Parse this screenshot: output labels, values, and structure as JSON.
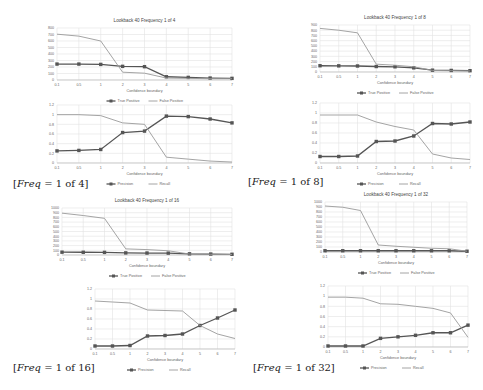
{
  "captions": [
    {
      "prefix": "[",
      "var": "Freq",
      "rest": " = 1 of 4]"
    },
    {
      "prefix": "[",
      "var": "Freq",
      "rest": " = 1 of 8]"
    },
    {
      "prefix": "[",
      "var": "Freq",
      "rest": " = 1 of 16]"
    },
    {
      "prefix": "[",
      "var": "Freq",
      "rest": " = 1 of 32]"
    }
  ],
  "colors": {
    "series_dark": "#555555",
    "series_light": "#9a9a9a",
    "grid": "#e2e2e2",
    "text": "#666666"
  },
  "chart_data": [
    {
      "type": "line",
      "title": "Lookback 40 Frequency 1 of 4",
      "xlabel": "Confidence boundary",
      "ylabel": "",
      "categories": [
        "0.1",
        "0.5",
        "1",
        "2",
        "3",
        "4",
        "5",
        "6",
        "7"
      ],
      "ylim": [
        0,
        800
      ],
      "yticks": [
        0,
        100,
        200,
        300,
        400,
        500,
        600,
        700,
        800
      ],
      "grid": true,
      "legend_position": "bottom",
      "series": [
        {
          "name": "True Positive",
          "marker": "square",
          "values": [
            245,
            245,
            240,
            210,
            205,
            50,
            40,
            30,
            25
          ]
        },
        {
          "name": "False Positive",
          "marker": "none",
          "values": [
            705,
            675,
            600,
            120,
            105,
            30,
            25,
            20,
            20
          ]
        }
      ]
    },
    {
      "type": "line",
      "title": "",
      "xlabel": "Confidence boundary",
      "ylabel": "",
      "categories": [
        "0.1",
        "0.5",
        "1",
        "2",
        "3",
        "4",
        "5",
        "6",
        "7"
      ],
      "ylim": [
        0,
        1.2
      ],
      "yticks": [
        0,
        0.2,
        0.4,
        0.6,
        0.8,
        1,
        1.2
      ],
      "grid": true,
      "legend_position": "bottom",
      "series": [
        {
          "name": "Precision",
          "marker": "square",
          "values": [
            0.25,
            0.26,
            0.28,
            0.63,
            0.66,
            0.97,
            0.96,
            0.91,
            0.83
          ]
        },
        {
          "name": "Recall",
          "marker": "none",
          "values": [
            1.0,
            1.0,
            0.98,
            0.83,
            0.8,
            0.12,
            0.08,
            0.04,
            0.02
          ]
        }
      ]
    },
    {
      "type": "line",
      "title": "Lookback 40 Frequency 1 of 8",
      "xlabel": "Confidence boundary",
      "ylabel": "",
      "categories": [
        "0.1",
        "0.5",
        "1",
        "2",
        "3",
        "4",
        "5",
        "6",
        "7"
      ],
      "ylim": [
        0,
        900
      ],
      "yticks": [
        0,
        100,
        200,
        300,
        400,
        500,
        600,
        700,
        800,
        900
      ],
      "grid": true,
      "legend_position": "bottom",
      "series": [
        {
          "name": "True Positive",
          "marker": "square",
          "values": [
            120,
            118,
            115,
            105,
            100,
            80,
            35,
            30,
            25
          ]
        },
        {
          "name": "False Positive",
          "marker": "none",
          "values": [
            835,
            800,
            750,
            150,
            130,
            100,
            30,
            25,
            20
          ]
        }
      ]
    },
    {
      "type": "line",
      "title": "",
      "xlabel": "Confidence boundary",
      "ylabel": "",
      "categories": [
        "0.1",
        "0.5",
        "1",
        "2",
        "3",
        "4",
        "5",
        "6",
        "7"
      ],
      "ylim": [
        0,
        1.2
      ],
      "yticks": [
        0,
        0.2,
        0.4,
        0.6,
        0.8,
        1,
        1.2
      ],
      "grid": true,
      "legend_position": "bottom",
      "series": [
        {
          "name": "Precision",
          "marker": "square",
          "values": [
            0.13,
            0.13,
            0.14,
            0.43,
            0.44,
            0.54,
            0.79,
            0.78,
            0.82
          ]
        },
        {
          "name": "Recall",
          "marker": "none",
          "values": [
            0.96,
            0.96,
            0.96,
            0.82,
            0.73,
            0.66,
            0.18,
            0.1,
            0.07
          ]
        }
      ]
    },
    {
      "type": "line",
      "title": "Lookback 40 Frequency 1 of 16",
      "xlabel": "Confidence boundary",
      "ylabel": "",
      "categories": [
        "0.1",
        "0.5",
        "1",
        "2",
        "3",
        "4",
        "5",
        "6",
        "7"
      ],
      "ylim": [
        0,
        1000
      ],
      "yticks": [
        0,
        100,
        200,
        300,
        400,
        500,
        600,
        700,
        800,
        900,
        1000
      ],
      "grid": true,
      "legend_position": "bottom",
      "series": [
        {
          "name": "True Positive",
          "marker": "square",
          "values": [
            60,
            58,
            56,
            45,
            42,
            40,
            25,
            20,
            15
          ]
        },
        {
          "name": "False Positive",
          "marker": "none",
          "values": [
            890,
            840,
            780,
            130,
            115,
            90,
            20,
            15,
            10
          ]
        }
      ]
    },
    {
      "type": "line",
      "title": "",
      "xlabel": "Confidence boundary",
      "ylabel": "",
      "categories": [
        "0.1",
        "0.5",
        "1",
        "2",
        "3",
        "4",
        "5",
        "6",
        "7"
      ],
      "ylim": [
        0,
        1.2
      ],
      "yticks": [
        0,
        0.2,
        0.4,
        0.6,
        0.8,
        1,
        1.2
      ],
      "grid": true,
      "legend_position": "bottom",
      "series": [
        {
          "name": "Precision",
          "marker": "square",
          "values": [
            0.06,
            0.06,
            0.07,
            0.26,
            0.27,
            0.3,
            0.47,
            0.62,
            0.78
          ]
        },
        {
          "name": "Recall",
          "marker": "none",
          "values": [
            0.96,
            0.94,
            0.92,
            0.78,
            0.77,
            0.76,
            0.47,
            0.3,
            0.21
          ]
        }
      ]
    },
    {
      "type": "line",
      "title": "Lookback 40 Frequency 1 of 32",
      "xlabel": "Confidence boundary",
      "ylabel": "",
      "categories": [
        "0.1",
        "0.5",
        "1",
        "2",
        "3",
        "4",
        "5",
        "6",
        "7"
      ],
      "ylim": [
        0,
        1000
      ],
      "yticks": [
        0,
        100,
        200,
        300,
        400,
        500,
        600,
        700,
        800,
        900,
        1000
      ],
      "grid": true,
      "legend_position": "bottom",
      "series": [
        {
          "name": "True Positive",
          "marker": "square",
          "values": [
            25,
            25,
            25,
            25,
            25,
            25,
            25,
            25,
            15
          ]
        },
        {
          "name": "False Positive",
          "marker": "none",
          "values": [
            920,
            895,
            830,
            140,
            115,
            95,
            75,
            65,
            15
          ]
        }
      ]
    },
    {
      "type": "line",
      "title": "",
      "xlabel": "Confidence boundary",
      "ylabel": "",
      "categories": [
        "0.1",
        "0.5",
        "1",
        "2",
        "3",
        "4",
        "5",
        "6",
        "7"
      ],
      "ylim": [
        0,
        1.2
      ],
      "yticks": [
        0,
        0.2,
        0.4,
        0.6,
        0.8,
        1,
        1.2
      ],
      "grid": true,
      "legend_position": "bottom",
      "series": [
        {
          "name": "Precision",
          "marker": "square",
          "values": [
            0.02,
            0.02,
            0.02,
            0.17,
            0.2,
            0.23,
            0.28,
            0.28,
            0.43
          ]
        },
        {
          "name": "Recall",
          "marker": "none",
          "values": [
            0.98,
            0.98,
            0.96,
            0.85,
            0.84,
            0.8,
            0.76,
            0.67,
            0.19
          ]
        }
      ]
    }
  ]
}
